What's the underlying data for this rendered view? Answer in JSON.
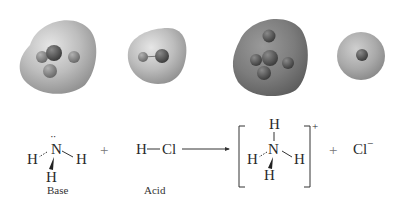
{
  "figure": {
    "type": "acid-base reaction with electrostatic potential maps",
    "models": [
      {
        "id": "nh3",
        "species": "NH3",
        "surface_color": "#b4b4b4",
        "atoms": 4
      },
      {
        "id": "hcl",
        "species": "HCl",
        "surface_color": "#bdbdbd",
        "atoms": 2
      },
      {
        "id": "nh4",
        "species": "NH4+",
        "surface_color": "#7a7a7a",
        "atoms": 5
      },
      {
        "id": "cl",
        "species": "Cl-",
        "surface_color": "#a8a8a8",
        "atoms": 1
      }
    ]
  },
  "equation": {
    "ammonia": {
      "center": "N",
      "h_left": "H",
      "h_right": "H",
      "h_bottom": "H",
      "lone_pair": "··"
    },
    "plus1": "+",
    "hcl": {
      "h": "H",
      "bond": "—",
      "cl": "Cl"
    },
    "arrow": "→",
    "ammonium": {
      "center": "N",
      "h_top": "H",
      "h_left": "H",
      "h_right": "H",
      "h_bottom": "H",
      "charge": "+"
    },
    "plus2": "+",
    "chloride": {
      "symbol": "Cl",
      "charge": "−"
    },
    "labels": {
      "base": "Base",
      "acid": "Acid"
    }
  }
}
